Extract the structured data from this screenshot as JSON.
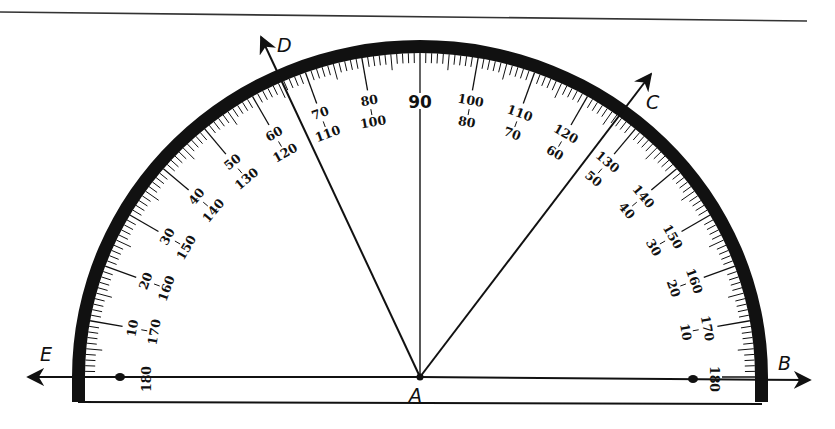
{
  "figure": {
    "center_label": "A",
    "ray_labels": {
      "left": "E",
      "right": "B",
      "ray_d": "D",
      "ray_c": "C"
    },
    "rays": [
      {
        "name": "AD",
        "label": "D",
        "angle_deg": 115
      },
      {
        "name": "AC",
        "label": "C",
        "angle_deg": 53
      },
      {
        "name": "AE",
        "label": "E",
        "angle_deg": 180
      },
      {
        "name": "AB",
        "label": "B",
        "angle_deg": 0
      }
    ],
    "scale": {
      "outer_labels": [
        "10",
        "20",
        "30",
        "40",
        "50",
        "60",
        "70",
        "80",
        "90",
        "100",
        "110",
        "120",
        "130",
        "140",
        "150",
        "160",
        "170",
        "180"
      ],
      "outer_label_angles": [
        170,
        160,
        150,
        140,
        130,
        120,
        110,
        100,
        90,
        80,
        70,
        60,
        50,
        40,
        30,
        20,
        10,
        0
      ],
      "inner_label_values_left": [
        "180",
        "170",
        "160",
        "150",
        "140",
        "130",
        "120",
        "110",
        "100"
      ],
      "inner_label_values_right": [
        "80",
        "70",
        "60",
        "50",
        "40",
        "30",
        "20",
        "10"
      ],
      "center_mark": "90",
      "minor_tick_step_deg": 1,
      "major_tick_step_deg": 10
    },
    "colors": {
      "ink": "#111111",
      "paper": "#ffffff"
    }
  }
}
